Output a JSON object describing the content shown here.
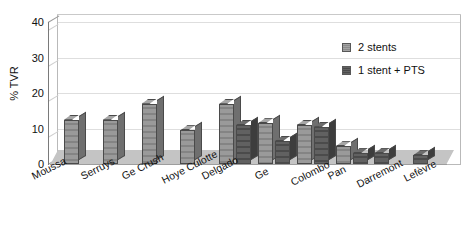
{
  "chart_data": {
    "type": "bar",
    "title": "",
    "subtitle": "",
    "xlabel": "",
    "ylabel": "% TVR",
    "ylim": [
      0,
      40
    ],
    "yticks": [
      0,
      10,
      20,
      30,
      40
    ],
    "grid": true,
    "legend_position": "top-right",
    "style": "3d-grouped-column",
    "categories": [
      "Moussa",
      "Serruys",
      "Ge Crush",
      "Hoye Culotte",
      "Delgado",
      "Ge",
      "Colombo",
      "Pan",
      "Darremont",
      "Lefèvre"
    ],
    "series": [
      {
        "name": "2 stents",
        "color": "#8f8f8f",
        "values": [
          12.5,
          12.5,
          17,
          9.5,
          17,
          11.5,
          11,
          5,
          null,
          null
        ]
      },
      {
        "name": "1 stent + PTS",
        "color": "#565656",
        "values": [
          null,
          null,
          null,
          null,
          11,
          6.5,
          10.5,
          3,
          3,
          2.5
        ]
      }
    ]
  },
  "axis": {
    "y_title": "% TVR",
    "y_tick_labels": [
      "0",
      "10",
      "20",
      "30",
      "40"
    ]
  },
  "legend": {
    "items": [
      {
        "label": "2 stents",
        "swatch": "light-gray-swatch"
      },
      {
        "label": "1 stent + PTS",
        "swatch": "dark-gray-swatch"
      }
    ]
  }
}
